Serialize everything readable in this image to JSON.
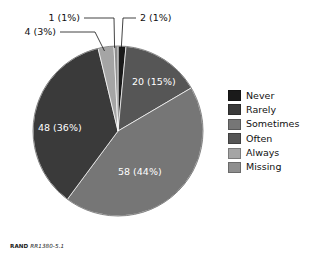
{
  "chart_data": {
    "type": "pie",
    "title": "",
    "subtitle": "",
    "xlabel": "",
    "ylabel": "",
    "legend_position": "right",
    "grid": false,
    "total": 133,
    "categories": [
      "Never",
      "Rarely",
      "Sometimes",
      "Often",
      "Always",
      "Missing"
    ],
    "labels": [
      "2 (1%)",
      "20 (15%)",
      "58 (44%)",
      "48 (36%)",
      "4 (3%)",
      "1 (1%)"
    ],
    "slices": [
      {
        "name": "Never",
        "value": 2,
        "percent": 1,
        "label": "2 (1%)",
        "color": "#1a1a1a",
        "label_placement": "callout"
      },
      {
        "name": "Often",
        "value": 20,
        "percent": 15,
        "label": "20 (15%)",
        "color": "#565656",
        "label_placement": "inside"
      },
      {
        "name": "Sometimes",
        "value": 58,
        "percent": 44,
        "label": "58 (44%)",
        "color": "#767676",
        "label_placement": "inside"
      },
      {
        "name": "Rarely",
        "value": 48,
        "percent": 36,
        "label": "48 (36%)",
        "color": "#3a3a3a",
        "label_placement": "inside"
      },
      {
        "name": "Always",
        "value": 4,
        "percent": 3,
        "label": "4 (3%)",
        "color": "#a5a5a5",
        "label_placement": "callout"
      },
      {
        "name": "Missing",
        "value": 1,
        "percent": 1,
        "label": "1 (1%)",
        "color": "#8e8e8e",
        "label_placement": "callout"
      }
    ]
  },
  "legend": {
    "items": [
      {
        "label": "Never",
        "color": "#1a1a1a"
      },
      {
        "label": "Rarely",
        "color": "#3a3a3a"
      },
      {
        "label": "Sometimes",
        "color": "#767676"
      },
      {
        "label": "Often",
        "color": "#565656"
      },
      {
        "label": "Always",
        "color": "#a5a5a5"
      },
      {
        "label": "Missing",
        "color": "#8e8e8e"
      }
    ]
  },
  "callouts": {
    "missing": "1 (1%)",
    "never": "2 (1%)",
    "always": "4 (3%)"
  },
  "inside_labels": {
    "often": "20 (15%)",
    "rarely": "48 (36%)",
    "sometimes": "58 (44%)"
  },
  "footer": {
    "source": "RAND",
    "number": "RR1380-5.1"
  }
}
